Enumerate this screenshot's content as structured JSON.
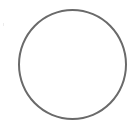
{
  "shape": {
    "type": "circle",
    "state": "empty",
    "stroke_color": "#6a6a6a",
    "fill_color": "#ffffff"
  },
  "background_color": "#ffffff"
}
